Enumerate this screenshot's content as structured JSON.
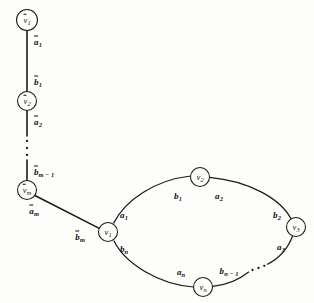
{
  "figure": {
    "type": "graph-diagram",
    "background_color": "#fdfdfb",
    "ink_color": "#1a1a1a"
  },
  "path_nodes": [
    {
      "name": "path-node-v1bar",
      "label": "v",
      "subscript": "1",
      "overline": true,
      "cx": 27,
      "cy": 20,
      "r": 10.5
    },
    {
      "name": "path-node-v2bar",
      "label": "v",
      "subscript": "2",
      "overline": true,
      "cx": 27,
      "cy": 101,
      "r": 9.5
    },
    {
      "name": "path-node-vmbar",
      "label": "v",
      "subscript": "m",
      "overline": true,
      "cx": 27,
      "cy": 190,
      "r": 9.5
    }
  ],
  "cycle_nodes": [
    {
      "name": "cycle-node-v1",
      "label": "v",
      "subscript": "1",
      "cx": 108,
      "cy": 232,
      "r": 9.5
    },
    {
      "name": "cycle-node-v2",
      "label": "v",
      "subscript": "2",
      "cx": 200,
      "cy": 177,
      "r": 9.5
    },
    {
      "name": "cycle-node-v3",
      "label": "v",
      "subscript": "3",
      "cx": 296,
      "cy": 227,
      "r": 9.5
    },
    {
      "name": "cycle-node-vn",
      "label": "v",
      "subscript": "n",
      "cx": 203,
      "cy": 287,
      "r": 9.5
    }
  ],
  "path_edge_labels": [
    {
      "name": "edge-label-a1bar",
      "label": "a",
      "subscript": "1",
      "overline": true,
      "x": 38,
      "y": 42
    },
    {
      "name": "edge-label-b1bar",
      "label": "b",
      "subscript": "1",
      "overline": true,
      "x": 38,
      "y": 82
    },
    {
      "name": "edge-label-a2bar",
      "label": "a",
      "subscript": "2",
      "overline": true,
      "x": 38,
      "y": 122
    },
    {
      "name": "edge-label-bm1bar",
      "label": "b",
      "subscript": "m − 1",
      "overline": true,
      "x": 36,
      "y": 172
    },
    {
      "name": "edge-label-ambar",
      "label": "a",
      "subscript": "m",
      "overline": true,
      "x": 34,
      "y": 211
    },
    {
      "name": "edge-label-bmbar",
      "label": "b",
      "subscript": "m",
      "overline": true,
      "x": 78,
      "y": 236
    }
  ],
  "cycle_edge_labels": [
    {
      "name": "edge-label-a1",
      "label": "a",
      "subscript": "1",
      "x": 124,
      "y": 215
    },
    {
      "name": "edge-label-b1",
      "label": "b",
      "subscript": "1",
      "x": 178,
      "y": 196
    },
    {
      "name": "edge-label-a2",
      "label": "a",
      "subscript": "2",
      "x": 218,
      "y": 196
    },
    {
      "name": "edge-label-b2",
      "label": "b",
      "subscript": "2",
      "x": 276,
      "y": 216
    },
    {
      "name": "edge-label-a3",
      "label": "a",
      "subscript": "3",
      "x": 280,
      "y": 246
    },
    {
      "name": "edge-label-bn1",
      "label": "b",
      "subscript": "n − 1",
      "x": 222,
      "y": 272
    },
    {
      "name": "edge-label-an",
      "label": "a",
      "subscript": "n",
      "x": 180,
      "y": 272
    },
    {
      "name": "edge-label-bn",
      "label": "b",
      "subscript": "n",
      "x": 124,
      "y": 248
    }
  ],
  "ellipsis": {
    "vertical_dots": {
      "name": "vertical-ellipsis",
      "cx": 27,
      "count": 3,
      "ys": [
        141,
        148,
        155
      ]
    },
    "arc_dots": {
      "name": "arc-ellipsis",
      "count": 3,
      "points": [
        [
          252,
          270
        ],
        [
          258,
          268
        ],
        [
          264,
          266
        ]
      ]
    }
  }
}
